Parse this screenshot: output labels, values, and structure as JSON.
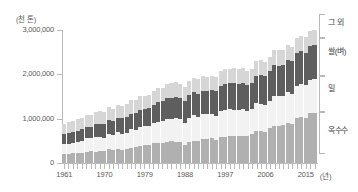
{
  "chart_data": {
    "type": "bar",
    "stacked": true,
    "title": "",
    "xlabel": "(년)",
    "ylabel": "(천 톤)",
    "ylim": [
      0,
      3000000
    ],
    "yticks": [
      0,
      1000000,
      2000000,
      3000000
    ],
    "ytick_labels": [
      "0",
      "1,000,000",
      "2,000,000",
      "3,000,000"
    ],
    "grid": false,
    "legend_position": "right",
    "x": [
      1961,
      1962,
      1963,
      1964,
      1965,
      1966,
      1967,
      1968,
      1969,
      1970,
      1971,
      1972,
      1973,
      1974,
      1975,
      1976,
      1977,
      1978,
      1979,
      1980,
      1981,
      1982,
      1983,
      1984,
      1985,
      1986,
      1987,
      1988,
      1989,
      1990,
      1991,
      1992,
      1993,
      1994,
      1995,
      1996,
      1997,
      1998,
      1999,
      2000,
      2001,
      2002,
      2003,
      2004,
      2005,
      2006,
      2007,
      2008,
      2009,
      2010,
      2011,
      2012,
      2013,
      2014,
      2015,
      2016,
      2017
    ],
    "xtick_labels": [
      "1961",
      "1970",
      "1979",
      "1988",
      "1997",
      "2006",
      "2015"
    ],
    "series": [
      {
        "name": "옥수수",
        "color": "#b0b0b0",
        "values": [
          205000,
          210000,
          220000,
          225000,
          235000,
          245000,
          260000,
          255000,
          270000,
          265000,
          305000,
          295000,
          315000,
          300000,
          325000,
          345000,
          365000,
          375000,
          410000,
          400000,
          445000,
          455000,
          450000,
          475000,
          490000,
          485000,
          475000,
          405000,
          475000,
          490000,
          500000,
          540000,
          535000,
          575000,
          525000,
          595000,
          590000,
          620000,
          615000,
          600000,
          620000,
          610000,
          650000,
          730000,
          715000,
          710000,
          795000,
          835000,
          825000,
          855000,
          895000,
          880000,
          1025000,
          1045000,
          1015000,
          1130000,
          1135000
        ]
      },
      {
        "name": "밀",
        "color": "#f2f2f2",
        "values": [
          225000,
          230000,
          240000,
          250000,
          270000,
          310000,
          295000,
          335000,
          320000,
          310000,
          350000,
          345000,
          375000,
          365000,
          360000,
          420000,
          390000,
          445000,
          430000,
          445000,
          455000,
          480000,
          495000,
          520000,
          505000,
          535000,
          510000,
          505000,
          540000,
          590000,
          545000,
          565000,
          560000,
          525000,
          545000,
          585000,
          615000,
          595000,
          585000,
          585000,
          590000,
          570000,
          560000,
          630000,
          625000,
          605000,
          610000,
          685000,
          685000,
          650000,
          700000,
          675000,
          715000,
          730000,
          735000,
          750000,
          770000
        ]
      },
      {
        "name": "쌀(벼)",
        "color": "#5e5e5e",
        "values": [
          215000,
          230000,
          240000,
          255000,
          255000,
          265000,
          260000,
          285000,
          300000,
          315000,
          320000,
          310000,
          335000,
          345000,
          355000,
          350000,
          370000,
          385000,
          375000,
          400000,
          410000,
          450000,
          450000,
          470000,
          470000,
          475000,
          475000,
          485000,
          510000,
          520000,
          520000,
          525000,
          530000,
          540000,
          550000,
          565000,
          575000,
          580000,
          610000,
          600000,
          600000,
          570000,
          585000,
          610000,
          635000,
          640000,
          660000,
          690000,
          685000,
          700000,
          725000,
          740000,
          745000,
          745000,
          740000,
          755000,
          770000
        ]
      },
      {
        "name": "그 외",
        "color": "#d6d6d6",
        "values": [
          240000,
          245000,
          250000,
          255000,
          265000,
          270000,
          265000,
          275000,
          275000,
          265000,
          285000,
          275000,
          290000,
          285000,
          295000,
          300000,
          290000,
          310000,
          305000,
          295000,
          305000,
          315000,
          300000,
          320000,
          330000,
          330000,
          320000,
          310000,
          315000,
          325000,
          320000,
          330000,
          325000,
          315000,
          320000,
          335000,
          330000,
          325000,
          335000,
          330000,
          330000,
          320000,
          325000,
          340000,
          340000,
          335000,
          330000,
          345000,
          345000,
          340000,
          345000,
          330000,
          345000,
          350000,
          345000,
          350000,
          350000
        ]
      }
    ],
    "legend": [
      {
        "label": "그 외",
        "color": "#d6d6d6"
      },
      {
        "label": "쌀(벼)",
        "color": "#5e5e5e"
      },
      {
        "label": "밀",
        "color": "#f2f2f2"
      },
      {
        "label": "옥수수",
        "color": "#b0b0b0"
      }
    ]
  }
}
